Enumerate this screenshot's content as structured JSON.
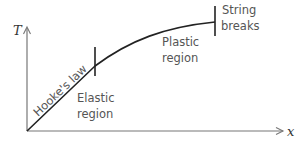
{
  "diagram": {
    "type": "tension-extension graph",
    "axes": {
      "y_label": "T",
      "x_label": "x"
    },
    "curve_label": "Hooke's law",
    "regions": [
      {
        "name": "elastic",
        "line1": "Elastic",
        "line2": "region"
      },
      {
        "name": "plastic",
        "line1": "Plastic",
        "line2": "region"
      }
    ],
    "annotation": {
      "line1": "String",
      "line2": "breaks"
    },
    "colors": {
      "curve": "#222222",
      "axes": "#777777",
      "text": "#555555",
      "background": "#ffffff"
    }
  }
}
